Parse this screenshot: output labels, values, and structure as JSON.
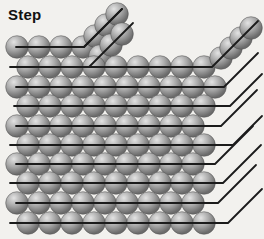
{
  "title": {
    "label": "Step"
  },
  "canvas": {
    "width": 264,
    "height": 239,
    "background": "#f2f1ee"
  },
  "style": {
    "line_color": "#1b1b1b",
    "line_width": 1.8,
    "atom_radius": 11.3,
    "atom_spacing": 22,
    "atom_gradient": {
      "highlight": "#e3e3e3",
      "mid": "#a7a7a7",
      "edge": "#6b6b6b",
      "rim": "#4d4d4d"
    }
  },
  "terrace_rows": [
    {
      "name": "row-1",
      "y": 47,
      "x_start": 17,
      "count": 4,
      "line_x1": 16,
      "bend_x": 84,
      "diag_len": 38
    },
    {
      "name": "row-2",
      "y": 67,
      "x_start": 28,
      "count": 9,
      "line_x1": 10,
      "bend_x": 212,
      "diag_len": 46
    },
    {
      "name": "row-3",
      "y": 87,
      "x_start": 17,
      "count": 10,
      "line_x1": 16,
      "bend_x": 224,
      "diag_len": 34
    },
    {
      "name": "row-4",
      "y": 106,
      "x_start": 28,
      "count": 9,
      "line_x1": 14,
      "bend_x": 230,
      "diag_len": 32
    },
    {
      "name": "row-5",
      "y": 126,
      "x_start": 17,
      "count": 9,
      "line_x1": 16,
      "bend_x": 221,
      "diag_len": 36
    },
    {
      "name": "row-6",
      "y": 145,
      "x_start": 28,
      "count": 9,
      "line_x1": 10,
      "bend_x": 233,
      "diag_len": 29
    },
    {
      "name": "row-7",
      "y": 164,
      "x_start": 17,
      "count": 9,
      "line_x1": 16,
      "bend_x": 215,
      "diag_len": 38
    },
    {
      "name": "row-8",
      "y": 183,
      "x_start": 28,
      "count": 9,
      "line_x1": 10,
      "bend_x": 223,
      "diag_len": 38
    },
    {
      "name": "row-9",
      "y": 203,
      "x_start": 17,
      "count": 9,
      "line_x1": 16,
      "bend_x": 218,
      "diag_len": 38
    },
    {
      "name": "row-10",
      "y": 223,
      "x_start": 28,
      "count": 9,
      "line_x1": 10,
      "bend_x": 228,
      "diag_len": 34
    }
  ],
  "step_chains": [
    {
      "name": "step-cluster-upper",
      "atoms": [
        [
          95,
          36
        ],
        [
          106,
          25
        ],
        [
          117,
          14
        ]
      ],
      "line": [
        84,
        47,
        122,
        9
      ]
    },
    {
      "name": "step-cluster-lower",
      "atoms": [
        [
          100,
          56
        ],
        [
          111,
          45
        ],
        [
          122,
          34
        ]
      ],
      "line": [
        89,
        67,
        133,
        23
      ]
    },
    {
      "name": "step-chain-right",
      "atoms": [
        [
          221,
          58
        ],
        [
          231,
          48
        ],
        [
          241,
          38
        ],
        [
          251,
          28
        ]
      ],
      "line": null
    }
  ],
  "draw_sequence": [
    "row-1",
    "step-cluster-upper",
    "step-cluster-lower",
    "row-2",
    "step-chain-right",
    "row-3",
    "row-4",
    "row-5",
    "row-6",
    "row-7",
    "row-8",
    "row-9",
    "row-10"
  ]
}
